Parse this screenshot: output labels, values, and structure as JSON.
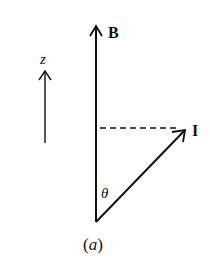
{
  "diagram": {
    "labels": {
      "b_vector": "B",
      "i_vector": "I",
      "z_axis": "z",
      "angle": "θ",
      "caption": "(a)"
    },
    "colors": {
      "stroke": "#111111",
      "background": "#ffffff"
    }
  }
}
